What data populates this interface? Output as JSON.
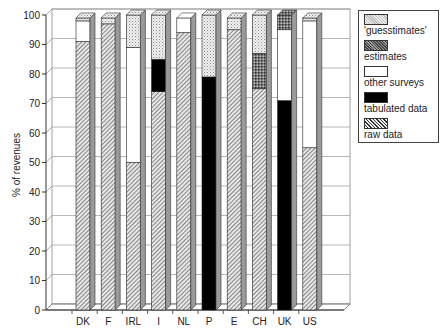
{
  "chart_data": {
    "type": "bar",
    "stacked": true,
    "style": "3d",
    "title": "",
    "xlabel": "",
    "ylabel": "% of revenues",
    "ylim": [
      0,
      100
    ],
    "yticks": [
      0,
      10,
      20,
      30,
      40,
      50,
      60,
      70,
      80,
      90,
      100
    ],
    "grid": true,
    "legend_position": "right",
    "categories": [
      "DK",
      "F",
      "IRL",
      "I",
      "NL",
      "P",
      "E",
      "CH",
      "UK",
      "US"
    ],
    "series": [
      {
        "name": "raw data",
        "values": [
          91,
          97,
          50,
          74,
          94,
          0,
          95,
          75,
          0,
          55
        ]
      },
      {
        "name": "tabulated data",
        "values": [
          0,
          0,
          0,
          11,
          0,
          79,
          0,
          0,
          71,
          0
        ]
      },
      {
        "name": "other surveys",
        "values": [
          7,
          0,
          39,
          0,
          5,
          0,
          0,
          0,
          24,
          43
        ]
      },
      {
        "name": "estimates",
        "values": [
          0,
          0,
          0,
          0,
          0,
          0,
          0,
          12,
          5,
          0
        ]
      },
      {
        "name": "'guesstimates'",
        "values": [
          1,
          2,
          11,
          15,
          0,
          21,
          4,
          13,
          0,
          1
        ]
      }
    ]
  },
  "legend": {
    "items": [
      {
        "label": "'guesstimates'",
        "pattern": "dots"
      },
      {
        "label": "estimates",
        "pattern": "crosshatch"
      },
      {
        "label": "other surveys",
        "pattern": "white"
      },
      {
        "label": "tabulated data",
        "pattern": "black"
      },
      {
        "label": "raw data",
        "pattern": "diagonal"
      }
    ]
  }
}
